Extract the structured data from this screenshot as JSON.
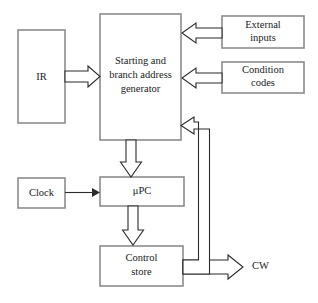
{
  "figure": {
    "type": "block-diagram",
    "background_color": "#ffffff",
    "box_stroke_color": "#8c8c8c",
    "line_color": "#2b2b2b",
    "text_color": "#1a1a1a"
  },
  "blocks": {
    "ir": {
      "label": "IR",
      "x": 18,
      "y": 30,
      "width": 47,
      "height": 93
    },
    "generator": {
      "label_line1": "Starting and",
      "label_line2": "branch address",
      "label_line3": "generator",
      "x": 100,
      "y": 14,
      "width": 81,
      "height": 126
    },
    "external_inputs": {
      "label_line1": "External",
      "label_line2": "inputs",
      "x": 222,
      "y": 16,
      "width": 82,
      "height": 32
    },
    "condition_codes": {
      "label_line1": "Condition",
      "label_line2": "codes",
      "x": 222,
      "y": 62,
      "width": 82,
      "height": 31
    },
    "clock": {
      "label": "Clock",
      "x": 18,
      "y": 178,
      "width": 47,
      "height": 30
    },
    "upc": {
      "label": "μPC",
      "x": 100,
      "y": 177,
      "width": 84,
      "height": 29
    },
    "control_store": {
      "label_line1": "Control",
      "label_line2": "store",
      "x": 100,
      "y": 246,
      "width": 83,
      "height": 40
    }
  },
  "free_labels": {
    "cw": {
      "text": "CW",
      "x": 252,
      "y": 267
    }
  },
  "connections": [
    {
      "name": "ir-to-generator",
      "from": "ir",
      "to": "generator",
      "style": "hollow-arrow",
      "direction": "right"
    },
    {
      "name": "external-inputs-to-generator",
      "from": "external_inputs",
      "to": "generator",
      "style": "hollow-arrow",
      "direction": "left"
    },
    {
      "name": "condition-codes-to-generator",
      "from": "condition_codes",
      "to": "generator",
      "style": "hollow-arrow",
      "direction": "left"
    },
    {
      "name": "generator-to-upc",
      "from": "generator",
      "to": "upc",
      "style": "hollow-arrow",
      "direction": "down"
    },
    {
      "name": "clock-to-upc",
      "from": "clock",
      "to": "upc",
      "style": "thin-arrow",
      "direction": "right"
    },
    {
      "name": "upc-to-control-store",
      "from": "upc",
      "to": "control_store",
      "style": "hollow-arrow",
      "direction": "down"
    },
    {
      "name": "control-store-to-cw",
      "from": "control_store",
      "to": "cw",
      "style": "hollow-arrow",
      "direction": "right"
    },
    {
      "name": "control-store-feedback-to-generator",
      "from": "control_store",
      "to": "generator",
      "style": "hollow-arrow",
      "direction": "up-then-left"
    }
  ]
}
